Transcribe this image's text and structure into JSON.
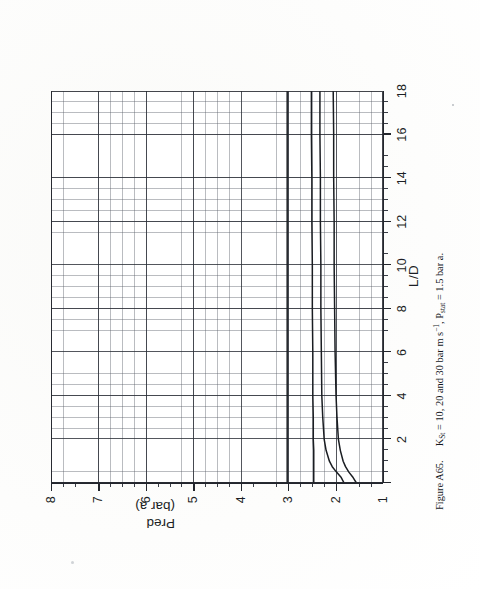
{
  "document": {
    "kind": "figure-page",
    "caption": {
      "figure_number": "Figure A65.",
      "text_parts": {
        "k_symbol": "K",
        "k_sub": "St",
        "eq1": " = 10, 20 and 30 bar m s",
        "exp": "−1",
        "comma": ", P",
        "p_sub": "stat",
        "eq2": " = 1.5 bar a."
      },
      "full_text": "Figure A65.   K_St = 10, 20 and 30 bar m s^-1, P_stat = 1.5 bar a."
    }
  },
  "chart_data": {
    "type": "line",
    "title": "",
    "subtitle": "",
    "xlabel": "L/D",
    "ylabel": "Pred (bar a)",
    "ylabel_line1": "Pred",
    "ylabel_line2": "(bar a)",
    "xlim": [
      0,
      18
    ],
    "ylim": [
      1,
      8
    ],
    "xticks": [
      0,
      2,
      4,
      6,
      8,
      10,
      12,
      14,
      16,
      18
    ],
    "xticklabels": [
      "",
      "2",
      "4",
      "6",
      "8",
      "10",
      "12",
      "14",
      "16",
      "18"
    ],
    "yticks": [
      1,
      2,
      3,
      4,
      5,
      6,
      7,
      8
    ],
    "yticklabels": [
      "1",
      "2",
      "3",
      "4",
      "5",
      "6",
      "7",
      "8"
    ],
    "grid": true,
    "grid_minor": true,
    "grid_major_x_step": 2,
    "grid_major_y_step": 1,
    "grid_minor_x_step": 0.5,
    "grid_minor_y_step": 0.25,
    "legend": "none",
    "legend_position": "none",
    "line_color": "#1a1d22",
    "grid_color": "#5a5f69",
    "series": [
      {
        "name": "Kst = 30 bar m s^-1",
        "x": [
          0.0,
          0.25,
          0.5,
          0.75,
          1.0,
          1.5,
          2.0,
          3.0,
          4.0,
          6.0,
          8.0,
          10.0,
          12.0,
          14.0,
          16.0,
          18.0
        ],
        "values": [
          3.02,
          3.02,
          3.02,
          3.02,
          3.02,
          3.02,
          3.02,
          3.02,
          3.02,
          3.02,
          3.02,
          3.02,
          3.02,
          3.02,
          3.02,
          3.02
        ]
      },
      {
        "name": "Kst = 20 bar m s^-1",
        "x": [
          0.0,
          0.25,
          0.5,
          0.75,
          1.0,
          1.5,
          2.0,
          3.0,
          4.0,
          6.0,
          8.0,
          10.0,
          12.0,
          14.0,
          16.0,
          18.0
        ],
        "values": [
          2.46,
          2.46,
          2.46,
          2.46,
          2.46,
          2.46,
          2.47,
          2.47,
          2.48,
          2.48,
          2.49,
          2.49,
          2.5,
          2.5,
          2.51,
          2.51
        ]
      },
      {
        "name": "Kst = 10 bar m s^-1",
        "x": [
          0.0,
          0.25,
          0.5,
          0.75,
          1.0,
          1.5,
          2.0,
          3.0,
          4.0,
          6.0,
          8.0,
          10.0,
          12.0,
          14.0,
          16.0,
          18.0
        ],
        "values": [
          1.82,
          1.88,
          1.98,
          2.07,
          2.13,
          2.2,
          2.24,
          2.27,
          2.29,
          2.3,
          2.31,
          2.31,
          2.32,
          2.32,
          2.33,
          2.33
        ]
      },
      {
        "name": "lower bound curve",
        "x": [
          0.0,
          0.25,
          0.5,
          0.75,
          1.0,
          1.5,
          2.0,
          3.0,
          4.0,
          6.0,
          8.0,
          10.0,
          12.0,
          14.0,
          16.0,
          18.0
        ],
        "values": [
          1.56,
          1.63,
          1.72,
          1.79,
          1.84,
          1.9,
          1.94,
          1.97,
          1.99,
          2.01,
          2.02,
          2.03,
          2.03,
          2.04,
          2.04,
          2.05
        ]
      }
    ]
  }
}
